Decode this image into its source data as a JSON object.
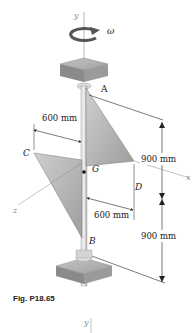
{
  "figure": {
    "caption": "Fig. P18.65",
    "axes": {
      "y": "y",
      "x": "x",
      "z": "z"
    },
    "rotation": {
      "symbol": "ω"
    },
    "points": {
      "A": "A",
      "B": "B",
      "C": "C",
      "D": "D",
      "G": "G"
    },
    "dimensions": {
      "upper_horizontal": "600 mm",
      "lower_horizontal": "600 mm",
      "upper_vertical": "900 mm",
      "lower_vertical": "900 mm"
    },
    "second_figure_axis": "y"
  }
}
